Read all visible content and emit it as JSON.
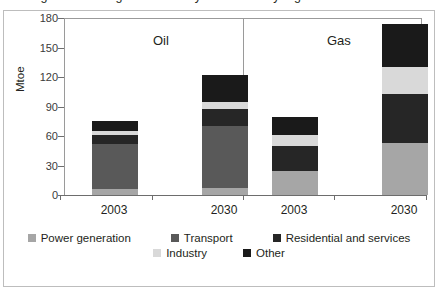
{
  "figure": {
    "cutoff_title": "Figure: Oil and gas demand by sector and by region"
  },
  "chart_data": {
    "type": "bar",
    "subtype": "stacked",
    "title": "",
    "xlabel": "",
    "ylabel": "Mtoe",
    "ylim": [
      0,
      180
    ],
    "yticks": [
      0,
      30,
      60,
      90,
      120,
      150,
      180
    ],
    "grid": false,
    "legend_position": "bottom",
    "panels": [
      "Oil",
      "Gas"
    ],
    "categories": [
      "2003",
      "2030",
      "2003",
      "2030"
    ],
    "category_panels": [
      "Oil",
      "Oil",
      "Gas",
      "Gas"
    ],
    "series": [
      {
        "name": "Power generation",
        "color": "#a6a6a6",
        "values": [
          6,
          7,
          24,
          53
        ]
      },
      {
        "name": "Transport",
        "color": "#595959",
        "values": [
          46,
          63,
          0,
          0
        ]
      },
      {
        "name": "Residential and services",
        "color": "#262626",
        "values": [
          9,
          18,
          26,
          50
        ]
      },
      {
        "name": "Industry",
        "color": "#d9d9d9",
        "values": [
          4,
          7,
          11,
          27
        ]
      },
      {
        "name": "Other",
        "color": "#1a1a1a",
        "values": [
          10,
          27,
          18,
          44
        ]
      }
    ],
    "totals": [
      75,
      122,
      79,
      174
    ]
  },
  "axis": {
    "y_title": "Mtoe",
    "y_tick_labels": [
      "180",
      "150",
      "120",
      "90",
      "60",
      "30",
      "0"
    ],
    "x_tick_labels": [
      "2003",
      "2030",
      "2003",
      "2030"
    ]
  },
  "panels": [
    {
      "label": "Oil"
    },
    {
      "label": "Gas"
    }
  ],
  "legend": {
    "row1": [
      {
        "label": "Power generation",
        "color": "#a6a6a6"
      },
      {
        "label": "Transport",
        "color": "#595959"
      },
      {
        "label": "Residential and services",
        "color": "#262626"
      }
    ],
    "row2": [
      {
        "label": "Industry",
        "color": "#d9d9d9"
      },
      {
        "label": "Other",
        "color": "#1a1a1a"
      }
    ]
  }
}
